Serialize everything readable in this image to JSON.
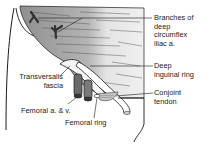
{
  "figure": {
    "colors": {
      "line": "#1a1a1a",
      "muscle_shade": "#9a9a9a",
      "muscle_light": "#d8d8d8",
      "background": "#ffffff"
    }
  },
  "labels": {
    "branches": [
      "Branches of",
      "deep",
      "circumflex",
      "iliac a."
    ],
    "deep_ring": [
      "Deep",
      "inguinal ring"
    ],
    "transversalis": [
      "Transversalis",
      "fascia"
    ],
    "conjoint": [
      "Conjoint",
      "tendon"
    ],
    "femoral_av": "Femoral a. & v.",
    "femoral_ring": "Femoral ring"
  }
}
